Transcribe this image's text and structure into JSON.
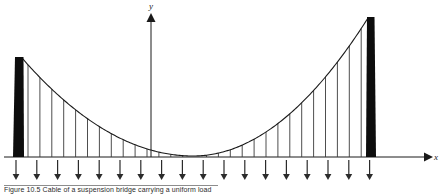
{
  "figure": {
    "axes": {
      "x_label": "x",
      "y_label": "y",
      "x_axis_y": 157,
      "y_axis_x": 151,
      "x_axis_start": 4,
      "x_axis_end": 430,
      "y_axis_top": 14
    },
    "towers": [
      {
        "name": "left-tower",
        "x_top": 15.0,
        "x_bottom": 13.0,
        "width_top": 8.5,
        "width_bottom": 11.0,
        "top_y": 57,
        "bottom_y": 157,
        "color": "#0d0d0d"
      },
      {
        "name": "right-tower",
        "x_top": 367.0,
        "x_bottom": 366.0,
        "width_top": 7.5,
        "width_bottom": 10.0,
        "top_y": 17,
        "bottom_y": 157,
        "color": "#0d0d0d"
      }
    ],
    "cable": {
      "name": "parabolic-cable",
      "left_anchor_x": 22,
      "left_anchor_y": 58,
      "right_anchor_x": 368,
      "right_anchor_y": 18,
      "vertex_x": 193,
      "vertex_y": 156,
      "stroke": "#1a1a1a",
      "stroke_width": 1.1
    },
    "hangers": {
      "name": "vertical-hangers",
      "count": 29,
      "first_x": 28,
      "spacing": 11.9,
      "stroke": "#3a3a3a",
      "stroke_width": 0.9,
      "baseline_y": 157
    },
    "load_arrows": {
      "name": "distributed-load-arrows",
      "count": 18,
      "first_x": 16,
      "spacing": 20.8,
      "top_y": 160,
      "tip_y": 180,
      "stroke": "#2b2b2b",
      "stroke_width": 1.2
    },
    "caption": {
      "label": "Figure",
      "number": "10.5",
      "text": "Figure 10.5  Cable of a suspension bridge carrying a uniform load"
    }
  }
}
